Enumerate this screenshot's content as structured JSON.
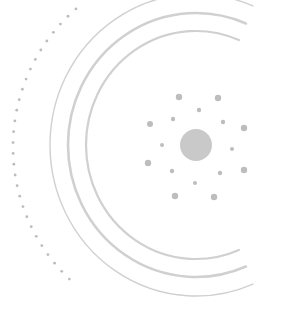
{
  "graphic": {
    "description": "Abstract radial illustration: central circle surrounded by scattered dots and concentric C-shaped arcs",
    "colors": {
      "background": "#ffffff",
      "center_circle": "#c9c9c9",
      "dots": "#bdbdbd",
      "arcs": "#d0d0d0",
      "dotted_arc": "#bcbcbc"
    },
    "center": {
      "cx": 196,
      "cy": 145,
      "r": 16
    },
    "dots": [
      {
        "cx": 179,
        "cy": 97,
        "r": 3.2
      },
      {
        "cx": 218,
        "cy": 98,
        "r": 3.2
      },
      {
        "cx": 199,
        "cy": 110,
        "r": 2.2
      },
      {
        "cx": 173,
        "cy": 119,
        "r": 2.2
      },
      {
        "cx": 223,
        "cy": 122,
        "r": 2.2
      },
      {
        "cx": 150,
        "cy": 124,
        "r": 3
      },
      {
        "cx": 244,
        "cy": 128,
        "r": 3.2
      },
      {
        "cx": 162,
        "cy": 145,
        "r": 2
      },
      {
        "cx": 232,
        "cy": 149,
        "r": 2
      },
      {
        "cx": 148,
        "cy": 163,
        "r": 3.2
      },
      {
        "cx": 172,
        "cy": 171,
        "r": 2.2
      },
      {
        "cx": 220,
        "cy": 173,
        "r": 2.2
      },
      {
        "cx": 244,
        "cy": 170,
        "r": 3.2
      },
      {
        "cx": 195,
        "cy": 183,
        "r": 2
      },
      {
        "cx": 175,
        "cy": 196,
        "r": 3.2
      },
      {
        "cx": 214,
        "cy": 197,
        "r": 3.2
      }
    ],
    "arcs": [
      {
        "rx": 110,
        "ry": 114,
        "width": 2.2
      },
      {
        "rx": 128,
        "ry": 132,
        "width": 2.6
      },
      {
        "rx": 146,
        "ry": 151,
        "width": 1.4
      }
    ],
    "dotted_arc": {
      "r": 183,
      "dot_radius": 1.4,
      "spacing_deg": 3.4,
      "start_deg": 131,
      "end_deg": 227
    }
  }
}
